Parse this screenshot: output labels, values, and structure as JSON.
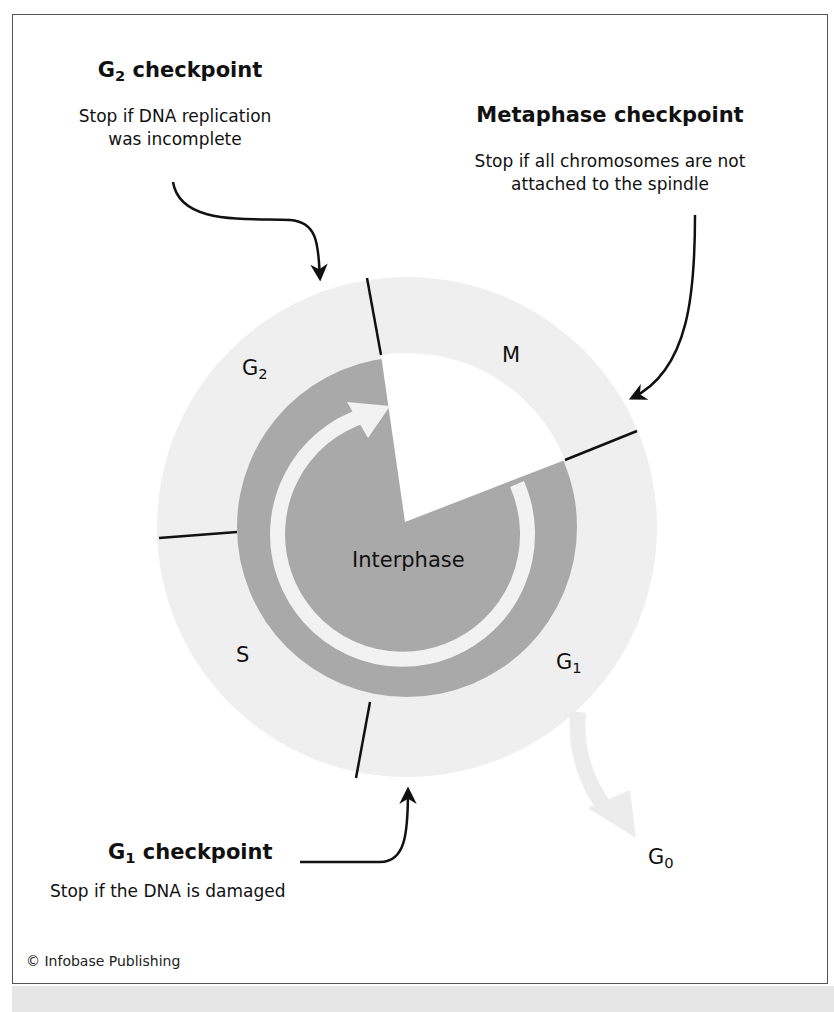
{
  "checkpoints": {
    "g2": {
      "title_main": "G",
      "title_sub": "2",
      "title_rest": " checkpoint",
      "desc_line1": "Stop if DNA replication",
      "desc_line2": "was incomplete"
    },
    "metaphase": {
      "title": "Metaphase checkpoint",
      "desc_line1": "Stop if all chromosomes are not",
      "desc_line2": "attached to the spindle"
    },
    "g1": {
      "title_main": "G",
      "title_sub": "1",
      "title_rest": " checkpoint",
      "desc": "Stop if the DNA is damaged"
    }
  },
  "phases": {
    "m": "M",
    "g2": {
      "main": "G",
      "sub": "2"
    },
    "s": "S",
    "g1": {
      "main": "G",
      "sub": "1"
    },
    "g0": {
      "main": "G",
      "sub": "0"
    },
    "interphase": "Interphase"
  },
  "colors": {
    "outer_ring": "#efefef",
    "interphase": "#a9a9a9",
    "m_sector": "#ffffff",
    "cycle_arrow": "#f2f2f2",
    "g0_arrow": "#ececec",
    "lines": "#111111"
  },
  "credit": "© Infobase Publishing"
}
